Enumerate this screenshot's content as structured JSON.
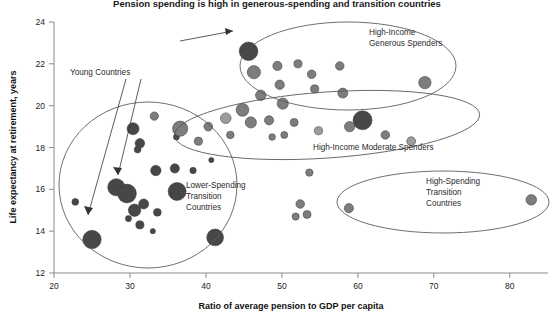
{
  "chart_data": {
    "type": "scatter",
    "title": "Pension spending is high in generous-spending and transition countries",
    "xlabel": "Ratio of average pension to GDP per capita",
    "ylabel": "Life expectancy at retirement, years",
    "xlim": [
      20,
      85
    ],
    "ylim": [
      12,
      24
    ],
    "xticks": [
      20,
      30,
      40,
      50,
      60,
      70,
      80
    ],
    "yticks": [
      12,
      14,
      16,
      18,
      20,
      22,
      24
    ],
    "grid": false,
    "legend_position": "none",
    "bubble_note": "Bubble area encodes relative size; shading distinguishes country groupings",
    "colors": {
      "dark": "#474747",
      "medium": "#7d7d7d",
      "light": "#9c9c9c"
    },
    "points": [
      {
        "x": 22.8,
        "y": 15.4,
        "r": 3.4,
        "shade": "dark"
      },
      {
        "x": 25.0,
        "y": 13.6,
        "r": 9.2,
        "shade": "dark"
      },
      {
        "x": 28.2,
        "y": 16.1,
        "r": 8.6,
        "shade": "dark"
      },
      {
        "x": 29.6,
        "y": 15.8,
        "r": 9.4,
        "shade": "dark"
      },
      {
        "x": 30.6,
        "y": 15.0,
        "r": 6.2,
        "shade": "dark"
      },
      {
        "x": 31.8,
        "y": 15.3,
        "r": 5.0,
        "shade": "dark"
      },
      {
        "x": 31.3,
        "y": 14.3,
        "r": 4.1,
        "shade": "dark"
      },
      {
        "x": 29.8,
        "y": 14.6,
        "r": 3.1,
        "shade": "dark"
      },
      {
        "x": 33.0,
        "y": 14.0,
        "r": 2.6,
        "shade": "dark"
      },
      {
        "x": 33.6,
        "y": 14.9,
        "r": 3.9,
        "shade": "dark"
      },
      {
        "x": 36.2,
        "y": 15.9,
        "r": 9.0,
        "shade": "dark"
      },
      {
        "x": 36.0,
        "y": 15.7,
        "r": 4.3,
        "shade": "dark"
      },
      {
        "x": 33.4,
        "y": 16.9,
        "r": 5.2,
        "shade": "dark"
      },
      {
        "x": 35.9,
        "y": 17.0,
        "r": 4.6,
        "shade": "dark"
      },
      {
        "x": 38.3,
        "y": 16.9,
        "r": 3.2,
        "shade": "dark"
      },
      {
        "x": 30.4,
        "y": 18.9,
        "r": 6.0,
        "shade": "dark"
      },
      {
        "x": 31.3,
        "y": 18.2,
        "r": 4.8,
        "shade": "dark"
      },
      {
        "x": 31.0,
        "y": 17.9,
        "r": 3.4,
        "shade": "dark"
      },
      {
        "x": 36.1,
        "y": 18.5,
        "r": 3.0,
        "shade": "dark"
      },
      {
        "x": 41.2,
        "y": 13.7,
        "r": 8.4,
        "shade": "dark"
      },
      {
        "x": 40.7,
        "y": 17.4,
        "r": 2.6,
        "shade": "dark"
      },
      {
        "x": 45.6,
        "y": 22.6,
        "r": 9.3,
        "shade": "dark"
      },
      {
        "x": 60.6,
        "y": 19.3,
        "r": 9.5,
        "shade": "dark"
      },
      {
        "x": 33.2,
        "y": 19.5,
        "r": 4.2,
        "shade": "medium"
      },
      {
        "x": 36.6,
        "y": 18.9,
        "r": 7.6,
        "shade": "medium"
      },
      {
        "x": 39.0,
        "y": 18.3,
        "r": 4.1,
        "shade": "medium"
      },
      {
        "x": 40.3,
        "y": 19.0,
        "r": 4.4,
        "shade": "medium"
      },
      {
        "x": 42.6,
        "y": 19.4,
        "r": 5.3,
        "shade": "light"
      },
      {
        "x": 43.2,
        "y": 18.6,
        "r": 3.8,
        "shade": "medium"
      },
      {
        "x": 44.8,
        "y": 19.8,
        "r": 6.4,
        "shade": "medium"
      },
      {
        "x": 45.9,
        "y": 19.2,
        "r": 5.6,
        "shade": "medium"
      },
      {
        "x": 48.3,
        "y": 19.3,
        "r": 4.6,
        "shade": "medium"
      },
      {
        "x": 48.7,
        "y": 18.5,
        "r": 3.3,
        "shade": "medium"
      },
      {
        "x": 50.3,
        "y": 18.6,
        "r": 3.5,
        "shade": "medium"
      },
      {
        "x": 51.6,
        "y": 19.2,
        "r": 4.0,
        "shade": "medium"
      },
      {
        "x": 54.8,
        "y": 18.8,
        "r": 4.1,
        "shade": "light"
      },
      {
        "x": 58.9,
        "y": 19.0,
        "r": 5.2,
        "shade": "medium"
      },
      {
        "x": 63.6,
        "y": 18.6,
        "r": 4.3,
        "shade": "medium"
      },
      {
        "x": 67.0,
        "y": 18.3,
        "r": 4.4,
        "shade": "light"
      },
      {
        "x": 46.3,
        "y": 21.6,
        "r": 6.6,
        "shade": "medium"
      },
      {
        "x": 47.2,
        "y": 20.5,
        "r": 5.2,
        "shade": "medium"
      },
      {
        "x": 49.4,
        "y": 21.9,
        "r": 4.6,
        "shade": "medium"
      },
      {
        "x": 49.7,
        "y": 21.0,
        "r": 4.7,
        "shade": "medium"
      },
      {
        "x": 50.1,
        "y": 20.1,
        "r": 5.6,
        "shade": "medium"
      },
      {
        "x": 52.1,
        "y": 22.0,
        "r": 4.1,
        "shade": "medium"
      },
      {
        "x": 53.9,
        "y": 21.5,
        "r": 4.3,
        "shade": "medium"
      },
      {
        "x": 54.3,
        "y": 20.8,
        "r": 4.1,
        "shade": "medium"
      },
      {
        "x": 57.6,
        "y": 21.9,
        "r": 4.3,
        "shade": "medium"
      },
      {
        "x": 58.0,
        "y": 20.6,
        "r": 5.0,
        "shade": "medium"
      },
      {
        "x": 68.8,
        "y": 21.1,
        "r": 6.2,
        "shade": "medium"
      },
      {
        "x": 53.6,
        "y": 16.8,
        "r": 3.7,
        "shade": "medium"
      },
      {
        "x": 52.4,
        "y": 15.3,
        "r": 4.3,
        "shade": "medium"
      },
      {
        "x": 51.8,
        "y": 14.7,
        "r": 3.6,
        "shade": "medium"
      },
      {
        "x": 53.3,
        "y": 14.8,
        "r": 4.0,
        "shade": "medium"
      },
      {
        "x": 58.8,
        "y": 15.1,
        "r": 4.6,
        "shade": "medium"
      },
      {
        "x": 82.8,
        "y": 15.5,
        "r": 5.3,
        "shade": "medium"
      }
    ],
    "annotations": [
      {
        "id": "high-income-generous-spenders",
        "lines": [
          "High-Income",
          "Generous Spenders"
        ],
        "x": 369,
        "y": 32
      },
      {
        "id": "high-income-moderate-spenders",
        "lines": [
          "High-Income Moderate Spenders"
        ],
        "x": 313,
        "y": 147
      },
      {
        "id": "lower-spending-transition-countries",
        "lines": [
          "Lower-Spending",
          "Transition",
          "Countries"
        ],
        "x": 186,
        "y": 185
      },
      {
        "id": "high-spending-transition-countries",
        "lines": [
          "High-Spending",
          "Transition",
          "Countries"
        ],
        "x": 426,
        "y": 181
      },
      {
        "id": "young-countries",
        "lines": [
          "Young Countries"
        ],
        "x": 70,
        "y": 72
      }
    ]
  }
}
